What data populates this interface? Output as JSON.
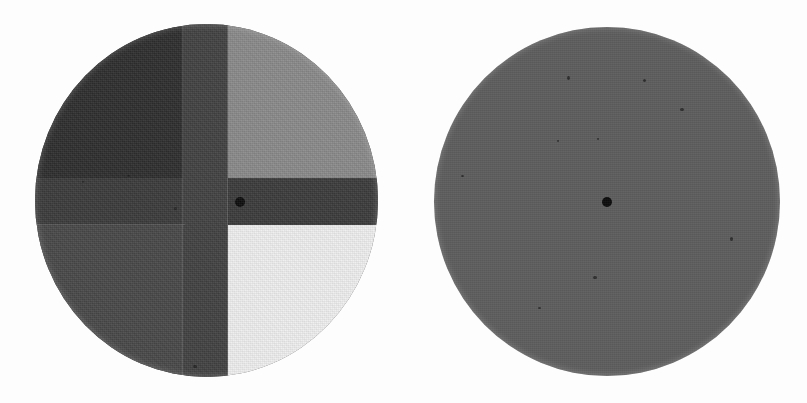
{
  "scene": {
    "title": "Two circular photometric test discs on a white field",
    "background_color": "#fdfdfd",
    "width": 807,
    "height": 403
  },
  "targets": [
    {
      "id": "quadrant-disc",
      "label": "Four-quadrant grayscale disc",
      "position": "left",
      "center": {
        "x": 206,
        "y": 200
      },
      "diameter": 348,
      "has_center_dot": true,
      "center_dot_color": "#0d0d0d",
      "center_dot_diameter": 10,
      "cross": {
        "label": "Dark cross divider",
        "vertical_arm_color": "#424242",
        "horizontal_arm_color": "#3c3c3c",
        "vertical_arm_width": 45,
        "horizontal_arm_height": 47
      },
      "quadrants": [
        {
          "name": "top-left",
          "label": "Darkest quadrant",
          "color": "#2e2e2e"
        },
        {
          "name": "top-right",
          "label": "Mid-gray quadrant",
          "color": "#8a8a8a"
        },
        {
          "name": "bottom-left",
          "label": "Dark-gray quadrant",
          "color": "#494949"
        },
        {
          "name": "bottom-right",
          "label": "Lightest quadrant",
          "color": "#efefef"
        }
      ]
    },
    {
      "id": "uniform-disc",
      "label": "Uniform gray reference disc",
      "position": "right",
      "center": {
        "x": 606,
        "y": 202
      },
      "diameter": 346,
      "fill_color": "#5e5e5e",
      "has_center_dot": true,
      "center_dot_color": "#0d0d0d",
      "center_dot_diameter": 10
    }
  ],
  "texture": {
    "type": "film-grain",
    "description": "Monochrome photographic grain across both discs"
  }
}
